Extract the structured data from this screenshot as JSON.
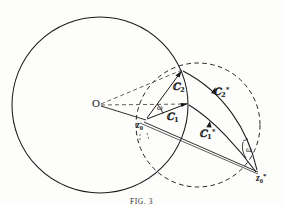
{
  "figure": {
    "caption": "FIG. 3",
    "title": "Fig. 3",
    "background_color": "#fdfdfc",
    "stroke_color": "#1a1a1a"
  },
  "labels": {
    "origin": "O",
    "z0": "z",
    "z0_sub": "0",
    "z0_star": "z",
    "z0_star_sub": "0",
    "z0_star_sup": "*",
    "S1": "ℂ",
    "S1_sub": "1",
    "S2": "ℂ",
    "S2_sub": "2",
    "S1_star": "ℂ",
    "S1_star_sub": "1",
    "S1_star_sup": "*",
    "S2_star": "ℂ",
    "S2_star_sub": "2",
    "S2_star_sup": "*",
    "omega_inner": "ω",
    "omega_outer": "ω"
  },
  "geometry": {
    "big_circle": {
      "cx": 100,
      "cy": 105,
      "r": 88,
      "style": "solid"
    },
    "dashed_circle": {
      "cx": 198,
      "cy": 125,
      "r": 62,
      "style": "dashed"
    },
    "points": {
      "O": {
        "x": 100,
        "y": 105
      },
      "z0": {
        "x": 146,
        "y": 120
      },
      "z0_star": {
        "x": 258,
        "y": 172
      },
      "apex": {
        "x": 182,
        "y": 70
      },
      "mid": {
        "x": 188,
        "y": 104
      }
    },
    "vectors": [
      {
        "name": "S1",
        "from": "z0",
        "to": "mid",
        "kind": "straight-arrow"
      },
      {
        "name": "S2",
        "from": "z0",
        "to": "apex",
        "kind": "straight-arrow"
      },
      {
        "name": "S1_star",
        "from": "z0_star",
        "to": "mid",
        "kind": "curved-arrow"
      },
      {
        "name": "S2_star",
        "from": "z0_star",
        "to": "apex",
        "kind": "curved-arrow"
      }
    ],
    "angle_markers": [
      {
        "name": "omega_inner",
        "at": "z0"
      },
      {
        "name": "omega_outer",
        "at": "z0_star"
      }
    ],
    "dashed_helpers": [
      {
        "from": "O",
        "to": "apex"
      },
      {
        "from": "O",
        "to": "mid"
      }
    ],
    "solid_helpers": [
      {
        "from": "O",
        "to": "z0"
      },
      {
        "from": "z0",
        "to": "z0_star"
      }
    ]
  }
}
